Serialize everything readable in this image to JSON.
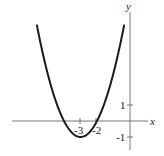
{
  "chart_data": {
    "type": "line",
    "title": "",
    "function": "f(x) = x^2 + 6x + 8",
    "xlabel": "x",
    "ylabel": "y",
    "x_ticks": [
      {
        "value": -3,
        "label": "-3"
      },
      {
        "value": -2,
        "label": "-2"
      }
    ],
    "y_ticks": [
      {
        "value": 1,
        "label": "1"
      },
      {
        "value": -1,
        "label": "-1"
      }
    ],
    "vertex": {
      "x": -3,
      "y": -1
    },
    "x_intercepts": [
      -4,
      -2
    ],
    "xlim": [
      -7.1,
      1.1
    ],
    "ylim": [
      -1.8,
      6.9
    ],
    "grid": false,
    "series": [
      {
        "name": "parabola",
        "x": [
          -5.8,
          -5,
          -4,
          -3.5,
          -3,
          -2.5,
          -2,
          -1,
          -0.4
        ],
        "y": [
          6.84,
          3,
          0,
          -0.75,
          -1,
          -0.75,
          0,
          3,
          5.76
        ]
      }
    ]
  },
  "labels": {
    "x_axis": "x",
    "y_axis": "y",
    "tick_x_neg3": "-3",
    "tick_x_neg2": "-2",
    "tick_y_1": "1",
    "tick_y_neg1": "-1"
  }
}
